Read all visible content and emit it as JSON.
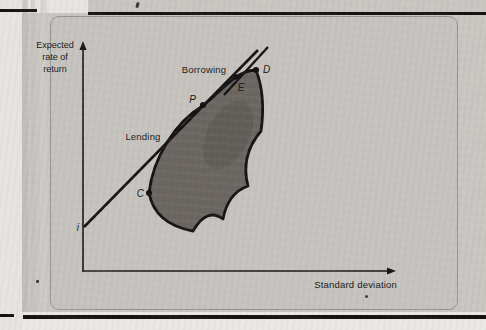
{
  "figure": {
    "y_axis_label": {
      "line1": "Expected",
      "line2": "rate of",
      "line3": "return"
    },
    "x_axis_label": "Standard deviation",
    "line_labels": {
      "borrowing": "Borrowing",
      "lending": "Lending"
    },
    "point_labels": {
      "p": "P",
      "e": "E",
      "d": "D",
      "c": "C",
      "i": "i"
    },
    "colors": {
      "page_grey": "#c9c6c2",
      "panel": "#c6c3bf",
      "page_margin": "#eae8e4",
      "feasible_region_fill": "#6b6662",
      "region_shade": "#575350",
      "ink": "#1b1916",
      "rule": "#161412"
    }
  }
}
